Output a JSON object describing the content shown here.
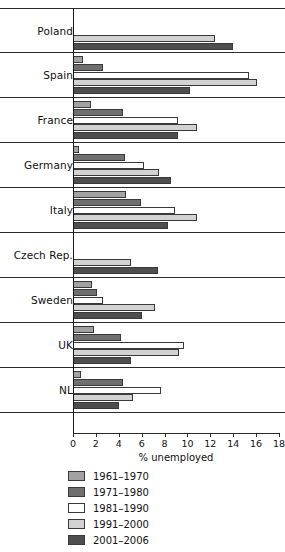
{
  "chart_data": {
    "type": "bar",
    "orientation": "horizontal",
    "title": "",
    "xlabel": "% unemployed",
    "ylabel": "",
    "xlim": [
      0,
      18
    ],
    "xticks": [
      0,
      2,
      4,
      6,
      8,
      10,
      12,
      14,
      16,
      18
    ],
    "xtick_labels": [
      "0",
      "2",
      "4",
      "6",
      "8",
      "10",
      "12",
      "14",
      "16",
      "18"
    ],
    "grid": false,
    "legend_position": "bottom-left",
    "categories": [
      "Poland",
      "Spain",
      "France",
      "Germany",
      "Italy",
      "Czech Rep.",
      "Sweden",
      "UK",
      "NL"
    ],
    "series": [
      {
        "name": "1961–1970",
        "color": "#a2a2a2",
        "values": [
          null,
          0.9,
          1.6,
          0.5,
          4.6,
          null,
          1.7,
          1.8,
          0.7
        ]
      },
      {
        "name": "1971–1980",
        "color": "#6f6f6f",
        "values": [
          null,
          2.6,
          4.4,
          4.5,
          5.9,
          null,
          2.1,
          4.2,
          4.4
        ]
      },
      {
        "name": "1981–1990",
        "color": "#ffffff",
        "values": [
          null,
          15.4,
          9.2,
          6.2,
          8.9,
          null,
          2.6,
          9.7,
          7.7
        ]
      },
      {
        "name": "1991–2000",
        "color": "#d2d2d2",
        "values": [
          12.4,
          16.1,
          10.8,
          7.5,
          10.8,
          5.1,
          7.2,
          9.3,
          5.2
        ]
      },
      {
        "name": "2001–2006",
        "color": "#4e4e4e",
        "values": [
          14.0,
          10.2,
          9.2,
          8.6,
          8.3,
          7.4,
          6.0,
          5.1,
          4.0
        ]
      }
    ]
  },
  "axis": {
    "x_title": "% unemployed"
  }
}
